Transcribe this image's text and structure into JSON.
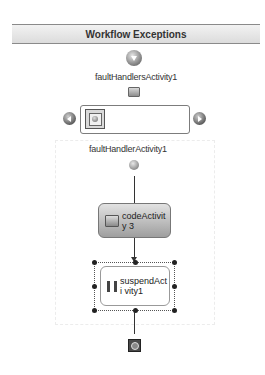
{
  "header": {
    "title": "Workflow Exceptions"
  },
  "fault_handlers": {
    "label": "faultHandlersActivity1",
    "nav_prev": "previous-handler",
    "nav_next": "next-handler"
  },
  "fault_handler": {
    "label": "faultHandlerActivity1",
    "activities": [
      {
        "label": "codeActivity3",
        "display": "codeActivity 3",
        "icon": "code-icon"
      },
      {
        "label": "suspendActivity1",
        "display": "suspendActi vity1",
        "icon": "pause-icon",
        "selected": true
      }
    ]
  },
  "colors": {
    "connector": "#333333",
    "code_activity_top": "#e2e2e2",
    "code_activity_bottom": "#9e9e9e",
    "selection": "#555555"
  }
}
